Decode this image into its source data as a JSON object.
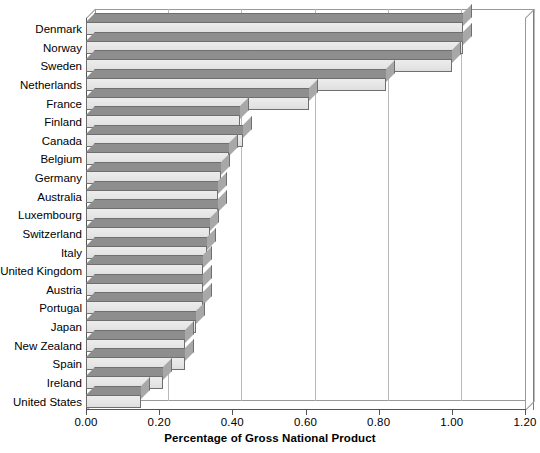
{
  "chart_data": {
    "type": "bar",
    "orientation": "horizontal",
    "title": "",
    "xlabel": "Percentage of Gross National Product",
    "ylabel": "",
    "xlim": [
      0.0,
      1.2
    ],
    "xticks": [
      "0.00",
      "0.20",
      "0.40",
      "0.60",
      "0.80",
      "1.00",
      "1.20"
    ],
    "xtick_values": [
      0.0,
      0.2,
      0.4,
      0.6,
      0.8,
      1.0,
      1.2
    ],
    "grid": true,
    "legend": "none",
    "style": "3d-bar",
    "categories": [
      "Denmark",
      "Norway",
      "Sweden",
      "Netherlands",
      "France",
      "Finland",
      "Canada",
      "Belgium",
      "Germany",
      "Australia",
      "Luxembourg",
      "Switzerland",
      "Italy",
      "United Kingdom",
      "Austria",
      "Portugal",
      "Japan",
      "New Zealand",
      "Spain",
      "Ireland",
      "United States"
    ],
    "values": [
      1.03,
      1.03,
      1.0,
      0.82,
      0.61,
      0.42,
      0.43,
      0.39,
      0.37,
      0.36,
      0.36,
      0.34,
      0.33,
      0.32,
      0.32,
      0.32,
      0.3,
      0.27,
      0.27,
      0.21,
      0.15
    ],
    "colors": {
      "bar_face": "#e6e6e6",
      "bar_top": "#8e8e8e",
      "bar_side": "#a8a8a8",
      "bar_outline": "#6f6f6f",
      "gridline": "#b9b9b9",
      "axis": "#555555",
      "background": "#ffffff"
    }
  }
}
